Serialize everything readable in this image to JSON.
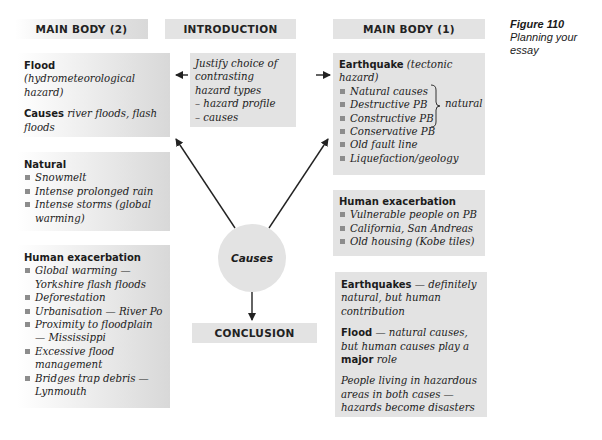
{
  "figure": {
    "number": "Figure 110",
    "title": "Planning your essay"
  },
  "headers": {
    "main_body_2": "MAIN BODY (2)",
    "introduction": "INTRODUCTION",
    "main_body_1": "MAIN BODY (1)",
    "conclusion": "CONCLUSION"
  },
  "center": {
    "label": "Causes"
  },
  "introduction_box": {
    "line1": "Justify choice of contrasting hazard types",
    "items": [
      "– hazard profile",
      "– causes"
    ]
  },
  "left_column": {
    "flood_box": {
      "title": "Flood",
      "subtitle": "(hydrometeorological hazard)",
      "causes_label": "Causes",
      "causes_text": "river floods, flash floods"
    },
    "natural_box": {
      "title": "Natural",
      "items": [
        "Snowmelt",
        "Intense prolonged rain",
        "Intense storms (global warming)"
      ]
    },
    "human_box": {
      "title": "Human exacerbation",
      "items": [
        "Global warming — Yorkshire flash floods",
        "Deforestation",
        "Urbanisation — River Po",
        "Proximity to floodplain — Mississippi",
        "Excessive flood management",
        "Bridges trap debris — Lynmouth"
      ]
    }
  },
  "right_column": {
    "earthquake_box": {
      "title": "Earthquake",
      "subtitle": "(tectonic hazard)",
      "items": [
        "Natural causes",
        "Destructive PB",
        "Constructive PB",
        "Conservative PB",
        "Old fault line",
        "Liquefaction/geology"
      ],
      "brace_label": "natural"
    },
    "human_box": {
      "title": "Human exacerbation",
      "items": [
        "Vulnerable people on PB",
        "California, San Andreas",
        "Old housing (Kobe tiles)"
      ]
    },
    "conclusion_box": {
      "p1_bold": "Earthquakes",
      "p1_text": " — definitely natural, but human contribution",
      "p2_bold": "Flood",
      "p2_text": " — natural causes, but human causes play a ",
      "p2_bold2": "major",
      "p2_text2": " role",
      "p3_text": "People living in hazardous areas in both cases — hazards become disasters"
    }
  }
}
